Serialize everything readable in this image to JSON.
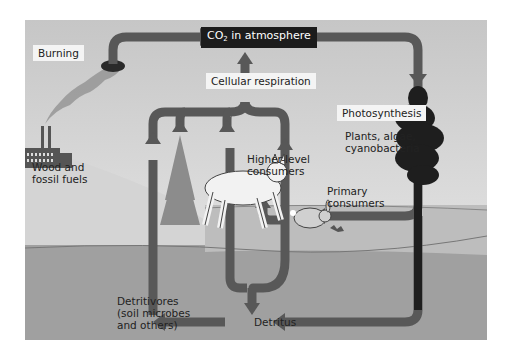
{
  "diagram": {
    "title_box": {
      "co2_prefix": "CO",
      "co2_sub": "2",
      "co2_suffix": " in atmosphere"
    },
    "labels": {
      "burning": "Burning",
      "cellular_respiration": "Cellular respiration",
      "photosynthesis": "Photosynthesis",
      "producers_line1": "Plants, algae,",
      "producers_line2": "cyanobacteria",
      "fuels_line1": "Wood and",
      "fuels_line2": "fossil fuels",
      "higher_line1": "Higher-level",
      "higher_line2": "consumers",
      "primary_line1": "Primary",
      "primary_line2": "consumers",
      "detritivores_line1": "Detritivores",
      "detritivores_line2": "(soil microbes",
      "detritivores_line3": "and others)",
      "detritus": "Detritus"
    },
    "colors": {
      "sky_top": "#c9c9c9",
      "sky_bottom": "#e8e8e8",
      "hill": "#d2d2d2",
      "ground": "#a8a8a8",
      "soil": "#8f8f8f",
      "arrow": "#555555",
      "tree_dark": "#1e1e1e",
      "label_bg": "#f4f4f4",
      "title_bg": "#1c1c1c"
    }
  }
}
